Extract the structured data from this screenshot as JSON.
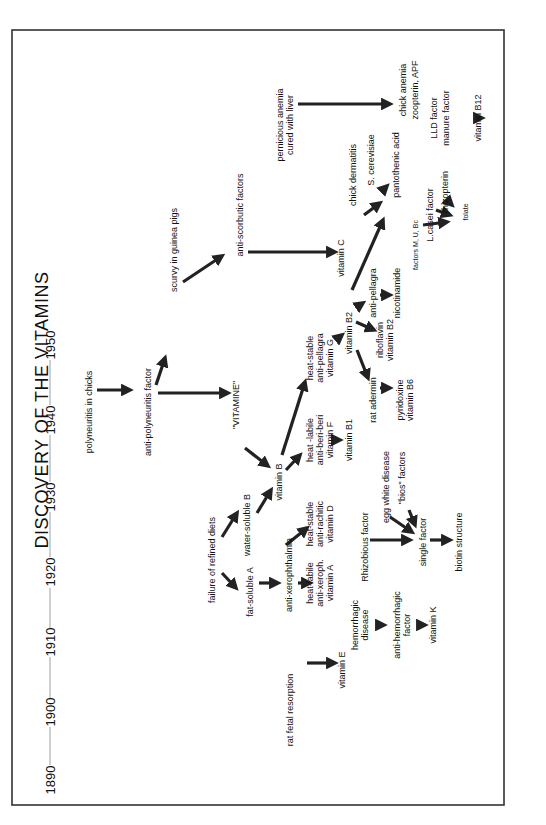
{
  "title": "DISCOVERY OF THE VITAMINS",
  "orientation": "rotated 90 degrees counter-clockwise",
  "timeline": {
    "years": [
      "1890",
      "1900",
      "1910",
      "1920",
      "1930",
      "1940",
      "1950"
    ]
  },
  "nodes": {
    "polyneuritis_chicks": [
      "polyneuritis in chicks"
    ],
    "anti_polyneuritis": [
      "anti-polyneuritis factor"
    ],
    "scurvy": [
      "scurvy in guinea pigs"
    ],
    "anti_scorbutic": [
      "anti-scorbutic factors"
    ],
    "pernicious": [
      "pernicious anemia",
      "cured with liver"
    ],
    "vitamine": [
      "\"VITAMINE\""
    ],
    "failure_diets": [
      "failure of refined diets"
    ],
    "water_soluble_b": [
      "water-soluble B"
    ],
    "fat_soluble_a": [
      "fat-soluble A"
    ],
    "vitamin_b": [
      "vitamin B"
    ],
    "anti_xerophthalmia": [
      "anti-xerophthalmia"
    ],
    "vitamin_a": [
      "heat-labile",
      "anti-xeroph.",
      "vitamin A"
    ],
    "vitamin_d": [
      "heat-stable",
      "anti-rachitic",
      "vitamin D"
    ],
    "rat_fetal": [
      "rat fetal resorption"
    ],
    "vitamin_e": [
      "vitamin E"
    ],
    "hemorrhagic": [
      "hemorrhagic",
      "disease"
    ],
    "anti_hemorrhagic": [
      "anti-hemorrhagic",
      "factor"
    ],
    "vitamin_k": [
      "vitamin K"
    ],
    "rhizobious": [
      "Rhizobious factor"
    ],
    "egg_white": [
      "egg white disease"
    ],
    "bios": [
      "\"bios\" factors"
    ],
    "single_factor": [
      "single factor"
    ],
    "biotin": [
      "biotin structure"
    ],
    "vitamin_f": [
      "heat -labile",
      "anti-beri-beri",
      "vitamin F"
    ],
    "vitamin_b1": [
      "vitamin B1"
    ],
    "vitamin_g": [
      "heat-stable",
      "anti-pellagra",
      "vitamin G"
    ],
    "vitamin_b2": [
      "vitamin B2"
    ],
    "rat_adermin": [
      "rat adermin"
    ],
    "vitamin_b6": [
      "pyridoxine",
      "vitamin B6"
    ],
    "riboflavin": [
      "riboflavin",
      "vitamin B2"
    ],
    "vitamin_c": [
      "vitamin C"
    ],
    "anti_pellagra": [
      "anti-pellagra"
    ],
    "nicotinamide": [
      "nicotinamide"
    ],
    "chick_dermatitis": [
      "chick dermatitis"
    ],
    "s_cerevisiae": [
      "S. cerevisiae"
    ],
    "pantothenic": [
      "pantothenic acid"
    ],
    "factors_mubc": [
      "factors M, U, Bc"
    ],
    "lcasei": [
      "L.casei factor"
    ],
    "rhizopterin": [
      "rhizopterin"
    ],
    "folate": [
      "folate"
    ],
    "chick_anemia": [
      "chick anemia",
      "zoopterin, APF"
    ],
    "lld": [
      "LLD factor",
      "manure factor"
    ],
    "vitamin_b12": [
      "vitamin B12"
    ]
  },
  "edges": [
    [
      "polyneuritis in chicks",
      "anti-polyneuritis factor"
    ],
    [
      "anti-polyneuritis factor",
      "scurvy in guinea pigs"
    ],
    [
      "anti-polyneuritis factor",
      "\"VITAMINE\""
    ],
    [
      "scurvy in guinea pigs",
      "anti-scorbutic factors"
    ],
    [
      "anti-scorbutic factors",
      "vitamin C"
    ],
    [
      "pernicious anemia cured with liver",
      "chick anemia zoopterin, APF"
    ],
    [
      "\"VITAMINE\"",
      "vitamin B"
    ],
    [
      "failure of refined diets",
      "water-soluble B"
    ],
    [
      "failure of refined diets",
      "fat-soluble A"
    ],
    [
      "water-soluble B",
      "vitamin B"
    ],
    [
      "fat-soluble A",
      "anti-xerophthalmia"
    ],
    [
      "anti-xerophthalmia",
      "vitamin A"
    ],
    [
      "anti-xerophthalmia",
      "vitamin D"
    ],
    [
      "vitamin B",
      "vitamin F"
    ],
    [
      "vitamin B",
      "vitamin G"
    ],
    [
      "vitamin F",
      "vitamin B1"
    ],
    [
      "vitamin G",
      "vitamin B2"
    ],
    [
      "vitamin B2",
      "rat adermin"
    ],
    [
      "vitamin B2",
      "riboflavin vitamin B2"
    ],
    [
      "vitamin B2",
      "anti-pellagra"
    ],
    [
      "vitamin B2",
      "pantothenic acid"
    ],
    [
      "rat adermin",
      "pyridoxine vitamin B6"
    ],
    [
      "anti-pellagra",
      "nicotinamide"
    ],
    [
      "chick dermatitis",
      "pantothenic acid"
    ],
    [
      "S. cerevisiae",
      "pantothenic acid"
    ],
    [
      "rat fetal resorption",
      "vitamin E"
    ],
    [
      "hemorrhagic disease",
      "anti-hemorrhagic factor"
    ],
    [
      "anti-hemorrhagic factor",
      "vitamin K"
    ],
    [
      "Rhizobious factor",
      "single factor"
    ],
    [
      "egg white disease",
      "single factor"
    ],
    [
      "\"bios\" factors",
      "single factor"
    ],
    [
      "single factor",
      "biotin structure"
    ],
    [
      "factors M, U, Bc",
      "folate"
    ],
    [
      "L.casei factor",
      "folate"
    ],
    [
      "rhizopterin",
      "folate"
    ],
    [
      "LLD factor manure factor",
      "vitamin B12"
    ]
  ],
  "colors": {
    "ink": "#111111",
    "arrow": "#222222",
    "timeline": "#888888",
    "frame": "#333333",
    "background": "#ffffff"
  }
}
